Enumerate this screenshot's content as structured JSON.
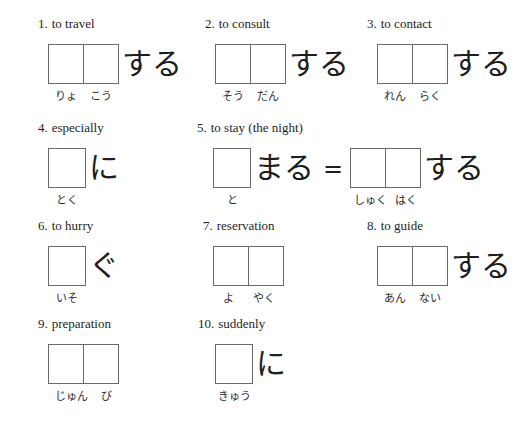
{
  "colors": {
    "background": "#ffffff",
    "ink": "#1e1e1e",
    "box_border": "#6a6a6a"
  },
  "items": [
    {
      "number": "1.",
      "meaning": "to travel",
      "boxes": 2,
      "suffix": "する",
      "readings": [
        "りょ",
        "こう"
      ]
    },
    {
      "number": "2.",
      "meaning": "to consult",
      "boxes": 2,
      "suffix": "する",
      "readings": [
        "そう",
        "だん"
      ]
    },
    {
      "number": "3.",
      "meaning": "to contact",
      "boxes": 2,
      "suffix": "する",
      "readings": [
        "れん",
        "らく"
      ]
    },
    {
      "number": "4.",
      "meaning": "especially",
      "boxes": 1,
      "suffix": "に",
      "readings": [
        "とく"
      ]
    },
    {
      "number": "5.",
      "meaning": "to stay (the night)",
      "part1": {
        "boxes": 1,
        "suffix": "まる",
        "readings": [
          "と"
        ]
      },
      "equals": "=",
      "part2": {
        "boxes": 2,
        "suffix": "する",
        "readings": [
          "しゅく",
          "はく"
        ]
      }
    },
    {
      "number": "6.",
      "meaning": "to hurry",
      "boxes": 1,
      "suffix": "ぐ",
      "readings": [
        "いそ"
      ]
    },
    {
      "number": "7.",
      "meaning": "reservation",
      "boxes": 2,
      "suffix": "",
      "readings": [
        "よ",
        "やく"
      ]
    },
    {
      "number": "8.",
      "meaning": "to guide",
      "boxes": 2,
      "suffix": "する",
      "readings": [
        "あん",
        "ない"
      ]
    },
    {
      "number": "9.",
      "meaning": "preparation",
      "boxes": 2,
      "suffix": "",
      "readings": [
        "じゅん",
        "び"
      ]
    },
    {
      "number": "10.",
      "meaning": "suddenly",
      "boxes": 1,
      "suffix": "に",
      "readings": [
        "きゅう"
      ]
    }
  ]
}
